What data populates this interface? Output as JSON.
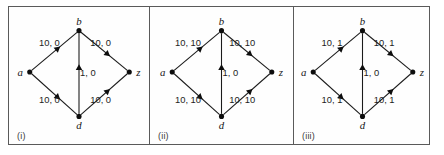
{
  "figure": {
    "type": "network-flow-diagram-triptych",
    "panel_count": 3
  },
  "panels": [
    {
      "caption": "(i)",
      "nodes": [
        {
          "id": "a",
          "label": "a",
          "x": 20,
          "y": 66
        },
        {
          "id": "b",
          "label": "b",
          "x": 70,
          "y": 24
        },
        {
          "id": "z",
          "label": "z",
          "x": 121,
          "y": 66
        },
        {
          "id": "d",
          "label": "d",
          "x": 70,
          "y": 111
        }
      ],
      "edges": [
        {
          "from": "a",
          "to": "b",
          "label": "10, 0",
          "label_x": 40,
          "label_y": 40
        },
        {
          "from": "b",
          "to": "z",
          "label": "10, 0",
          "label_x": 92,
          "label_y": 40
        },
        {
          "from": "a",
          "to": "d",
          "label": "10, 0",
          "label_x": 40,
          "label_y": 97
        },
        {
          "from": "d",
          "to": "z",
          "label": "10, 0",
          "label_x": 92,
          "label_y": 97
        },
        {
          "from": "d",
          "to": "b",
          "label": "1, 0",
          "label_x": 79,
          "label_y": 70
        }
      ]
    },
    {
      "caption": "(ii)",
      "nodes": [
        {
          "id": "a",
          "label": "a",
          "x": 22,
          "y": 66
        },
        {
          "id": "b",
          "label": "b",
          "x": 72,
          "y": 24
        },
        {
          "id": "z",
          "label": "z",
          "x": 123,
          "y": 66
        },
        {
          "id": "d",
          "label": "d",
          "x": 72,
          "y": 111
        }
      ],
      "edges": [
        {
          "from": "a",
          "to": "b",
          "label": "10, 10",
          "label_x": 38,
          "label_y": 40
        },
        {
          "from": "b",
          "to": "z",
          "label": "10, 10",
          "label_x": 93,
          "label_y": 40
        },
        {
          "from": "a",
          "to": "d",
          "label": "10, 10",
          "label_x": 38,
          "label_y": 97
        },
        {
          "from": "d",
          "to": "z",
          "label": "10, 10",
          "label_x": 93,
          "label_y": 97
        },
        {
          "from": "d",
          "to": "b",
          "label": "1, 0",
          "label_x": 81,
          "label_y": 70
        }
      ]
    },
    {
      "caption": "(iii)",
      "nodes": [
        {
          "id": "a",
          "label": "a",
          "x": 19,
          "y": 66
        },
        {
          "id": "b",
          "label": "b",
          "x": 69,
          "y": 24
        },
        {
          "id": "z",
          "label": "z",
          "x": 120,
          "y": 66
        },
        {
          "id": "d",
          "label": "d",
          "x": 69,
          "y": 111
        }
      ],
      "edges": [
        {
          "from": "a",
          "to": "b",
          "label": "10, 1",
          "label_x": 38,
          "label_y": 40
        },
        {
          "from": "b",
          "to": "z",
          "label": "10, 1",
          "label_x": 91,
          "label_y": 40
        },
        {
          "from": "a",
          "to": "d",
          "label": "10, 1",
          "label_x": 38,
          "label_y": 97
        },
        {
          "from": "d",
          "to": "z",
          "label": "10, 1",
          "label_x": 91,
          "label_y": 97
        },
        {
          "from": "d",
          "to": "b",
          "label": "1, 0",
          "label_x": 78,
          "label_y": 70
        }
      ]
    }
  ],
  "colors": {
    "stroke": "#1b1b1b",
    "frame": "#5a5a5a",
    "background": "#ffffff",
    "node": "#0d0d0d"
  }
}
